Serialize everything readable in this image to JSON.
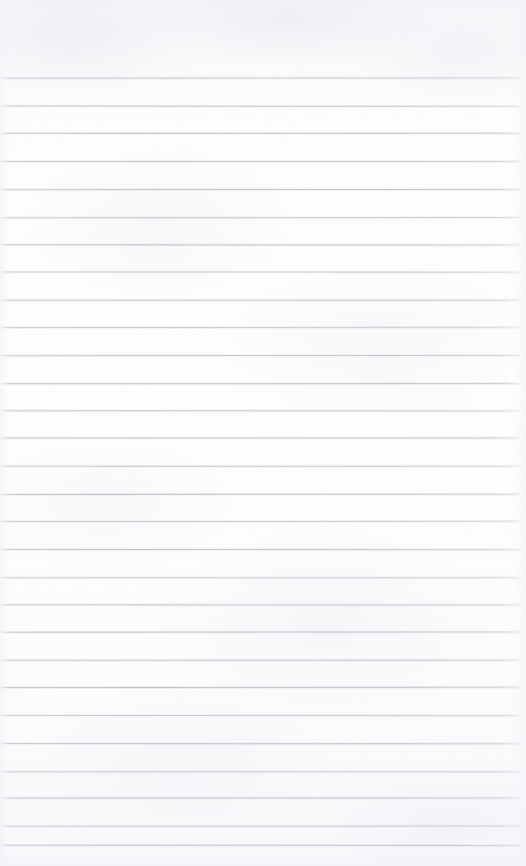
{
  "document": {
    "kind": "ruled-paper-scan",
    "title": "Blank ruled paper",
    "content_text": "",
    "written_content": "none",
    "page_width": 526,
    "page_height": 866,
    "background_color": "#fdfdfe",
    "paper_tint": "#f8f9fb"
  },
  "ruling": {
    "line_color": "#bcbfc6",
    "line_thickness": 1,
    "line_spacing": 27.7,
    "first_line_y": 78,
    "last_line_y": 845,
    "line_start_x": 0,
    "line_end_x": 520,
    "line_count": 29,
    "top_margin_height": 78,
    "right_margin_width": 6,
    "margin_rule": "none",
    "line_y_positions": [
      78,
      105.7,
      133.4,
      161.1,
      188.8,
      216.5,
      244.2,
      271.9,
      299.6,
      327.3,
      355,
      382.7,
      410.4,
      438.1,
      465.8,
      493.5,
      521.2,
      548.9,
      576.6,
      604.3,
      632,
      659.7,
      687.4,
      715.1,
      742.8,
      770.5,
      798.2,
      825.9,
      845
    ]
  }
}
